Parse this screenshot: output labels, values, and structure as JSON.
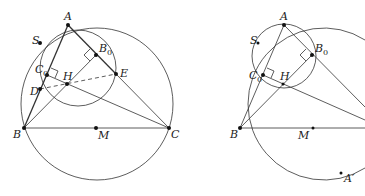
{
  "figures": [
    {
      "name": "left",
      "labels": {
        "A": "A",
        "S": "S",
        "B0": "B",
        "C0": "C",
        "H": "H",
        "D": "D",
        "E": "E",
        "B": "B",
        "M": "M",
        "C": "C"
      }
    },
    {
      "name": "right",
      "labels": {
        "A": "A",
        "S": "S",
        "B0": "B",
        "C0": "C",
        "H": "H",
        "B": "B",
        "M": "M",
        "Ap": "A′"
      }
    }
  ],
  "subscript": "0"
}
